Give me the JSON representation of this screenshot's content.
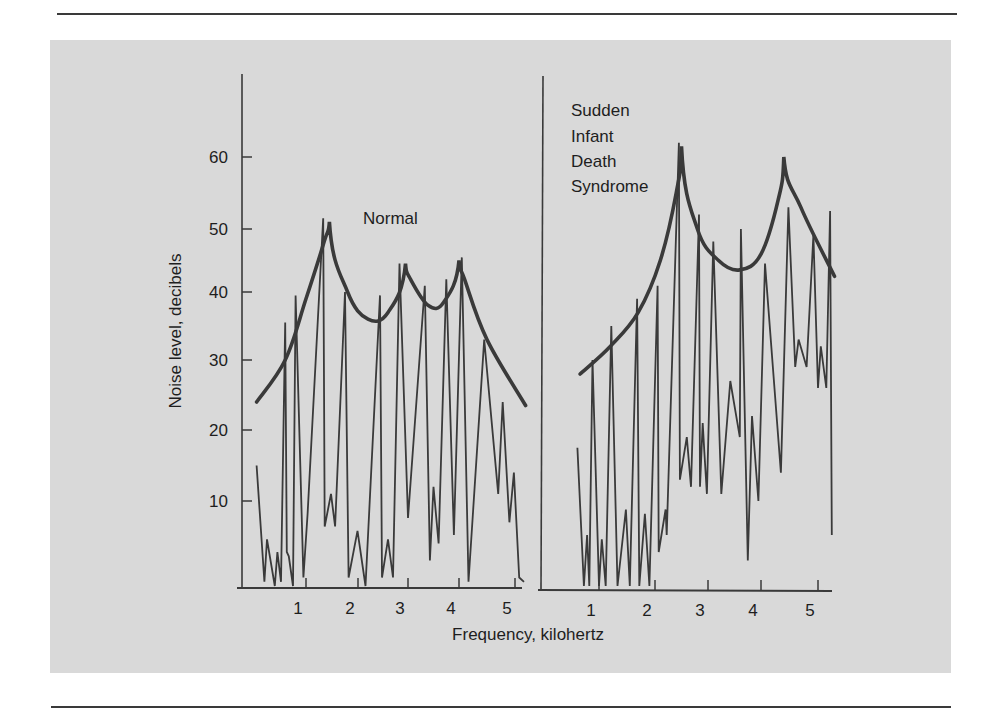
{
  "chart_data": {
    "type": "line",
    "title": "",
    "xlabel": "Frequency, kilohertz",
    "ylabel": "Noise level, decibels",
    "ylim": [
      0,
      70
    ],
    "grid": false,
    "legend": "none (panels annotated directly)",
    "yticks": [
      10,
      20,
      30,
      40,
      50,
      60
    ],
    "xticks": [
      1,
      2,
      3,
      4,
      5
    ],
    "panels": [
      {
        "id": "normal",
        "annotation": "Normal",
        "xlim": [
          0,
          5.2
        ],
        "series": [
          {
            "name": "Spectrum",
            "style": "thin jagged line",
            "x": [
              0.05,
              0.2,
              0.25,
              0.4,
              0.45,
              0.52,
              0.6,
              0.63,
              0.67,
              0.75,
              0.8,
              0.95,
              1.03,
              1.33,
              1.36,
              1.48,
              1.56,
              1.75,
              1.82,
              1.99,
              2.15,
              2.44,
              2.48,
              2.6,
              2.7,
              2.83,
              3.0,
              3.33,
              3.43,
              3.5,
              3.6,
              3.75,
              3.9,
              4.05,
              4.17,
              4.45,
              4.7,
              4.78,
              4.9,
              4.98,
              5.08,
              5.17
            ],
            "y": [
              15,
              0.5,
              5.5,
              0,
              4,
              0.5,
              35.5,
              4,
              3.5,
              0,
              39.5,
              1,
              8.5,
              51.5,
              7,
              11,
              7,
              40,
              1,
              6.5,
              0,
              39.5,
              1,
              5.5,
              1,
              44.5,
              8,
              41,
              3,
              12,
              5,
              42,
              6,
              45.5,
              0.5,
              33,
              11,
              24,
              7.5,
              14,
              1,
              0.5
            ]
          },
          {
            "name": "Envelope",
            "style": "thick smooth curve",
            "x": [
              0.05,
              0.6,
              1.0,
              1.35,
              1.45,
              1.8,
              2.2,
              2.6,
              2.95,
              3.05,
              3.4,
              3.7,
              4.0,
              4.1,
              4.5,
              5.2
            ],
            "y": [
              24,
              30,
              39,
              48,
              51,
              40,
              36,
              37,
              44.5,
              42,
              38,
              38.5,
              45,
              42,
              33,
              23.5
            ]
          }
        ]
      },
      {
        "id": "sids",
        "annotation": "Sudden Infant Death Syndrome",
        "annotation_lines": [
          "Sudden",
          "Infant",
          "Death",
          "Syndrome"
        ],
        "xlim": [
          0,
          5.3
        ],
        "series": [
          {
            "name": "Spectrum",
            "style": "thin jagged line",
            "x": [
              0.6,
              0.72,
              0.78,
              0.82,
              0.88,
              1.0,
              1.05,
              1.12,
              1.22,
              1.33,
              1.48,
              1.55,
              1.68,
              1.72,
              1.82,
              1.9,
              2.05,
              2.07,
              2.2,
              2.22,
              2.45,
              2.47,
              2.6,
              2.68,
              2.83,
              2.85,
              2.9,
              2.93,
              2.98,
              3.1,
              3.25,
              3.42,
              3.6,
              3.62,
              3.75,
              3.83,
              3.95,
              4.07,
              4.35,
              4.48,
              4.6,
              4.66,
              4.8,
              4.92,
              5.0,
              5.05,
              5.15,
              5.22
            ],
            "y": [
              17.5,
              0,
              6,
              0,
              30,
              0,
              5.5,
              0,
              35,
              0,
              9,
              0,
              39,
              0,
              8.5,
              0,
              41,
              4,
              9,
              6,
              62,
              13,
              19,
              12,
              52,
              12,
              21,
              17,
              11,
              48,
              11,
              27,
              19,
              50,
              3,
              22,
              10,
              44.5,
              14,
              53,
              29,
              33,
              29,
              49,
              26,
              32,
              26,
              52.5
            ],
            "tail": {
              "x": 5.25,
              "y": 6
            }
          },
          {
            "name": "Envelope",
            "style": "thick smooth curve",
            "x": [
              0.65,
              1.2,
              1.7,
              2.1,
              2.4,
              2.5,
              2.8,
              3.2,
              3.6,
              4.0,
              4.3,
              4.4,
              4.7,
              5.3
            ],
            "y": [
              28,
              32,
              37,
              45,
              55,
              61.5,
              50,
              45,
              43.5,
              46,
              54,
              60,
              53,
              42.5
            ]
          }
        ]
      }
    ]
  },
  "labels": {
    "y_axis_title": "Noise level, decibels",
    "x_axis_title": "Frequency, kilohertz",
    "normal_annotation": "Normal",
    "sids_annotation": [
      "Sudden",
      "Infant",
      "Death",
      "Syndrome"
    ],
    "y_tick_labels": [
      "10",
      "20",
      "30",
      "40",
      "50",
      "60"
    ],
    "x_tick_labels": [
      "1",
      "2",
      "3",
      "4",
      "5"
    ]
  },
  "colors": {
    "panel_background": "#d9d9d9",
    "line": "#3a3a3a",
    "text": "#1e1e1e",
    "page_background": "#ffffff"
  }
}
